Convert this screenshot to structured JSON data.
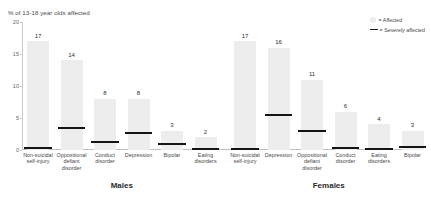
{
  "chart_data": {
    "type": "bar",
    "title": "",
    "ylabel": "% of 13-18 year olds affected",
    "xlabel": "",
    "ylim": [
      0,
      20
    ],
    "yticks": [
      "0",
      "5",
      "10",
      "15",
      "20"
    ],
    "grid": false,
    "legend_position": "top-right",
    "legend": [
      {
        "marker": "affected-swatch",
        "label": "= Affected"
      },
      {
        "marker": "severely-affected-line",
        "label": "= Severely affected"
      }
    ],
    "groups": [
      {
        "name": "Males",
        "categories": [
          "Non-suicidal self-injury",
          "Oppositional defiant disorder",
          "Conduct disorder",
          "Depression",
          "Bipolar",
          "Eating disorders"
        ],
        "series": [
          {
            "name": "Affected",
            "values": [
              17,
              14,
              8,
              8,
              3,
              2
            ]
          },
          {
            "name": "Severely affected",
            "values": [
              0.3,
              3.5,
              1.2,
              2.6,
              1.0,
              0.1
            ]
          }
        ]
      },
      {
        "name": "Females",
        "categories": [
          "Non-suicidal self-injury",
          "Depression",
          "Oppositional defiant disorder",
          "Conduct disorder",
          "Eating disorders",
          "Bipolar"
        ],
        "series": [
          {
            "name": "Affected",
            "values": [
              17,
              16,
              11,
              6,
              4,
              3
            ]
          },
          {
            "name": "Severely affected",
            "values": [
              0.2,
              5.4,
              3.0,
              0.3,
              0.1,
              0.5
            ]
          }
        ]
      }
    ]
  },
  "colors": {
    "bar_fill": "#ededed",
    "severe_line": "#141414",
    "axis": "#c9c9c9",
    "text": "#4a4a4a"
  },
  "labels": {
    "males_title": "Males",
    "females_title": "Females"
  }
}
